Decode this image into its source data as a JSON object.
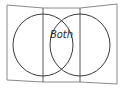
{
  "diagram": {
    "type": "venn",
    "sets": [
      {
        "id": "left",
        "label": ""
      },
      {
        "id": "right",
        "label": ""
      }
    ],
    "regions": {
      "left_only": "",
      "intersection": "Both",
      "right_only": ""
    },
    "colors": {
      "frame": "#8a8a8a",
      "divider": "#5a5a5a",
      "circle": "#3a3a3a",
      "text": "#2a2a2a",
      "background": "#ffffff"
    }
  }
}
